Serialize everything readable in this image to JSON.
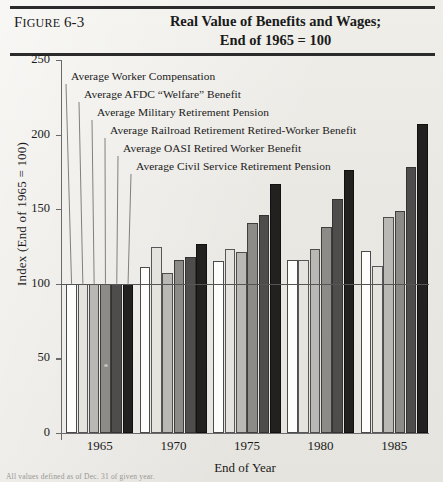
{
  "figure": {
    "label_prefix": "F",
    "label_rest": "IGURE",
    "number": "6-3",
    "title_line1": "Real Value of Benefits and Wages;",
    "title_line2": "End of 1965 = 100"
  },
  "footnote": "All values defined as of Dec. 31 of given year.",
  "chart_data": {
    "type": "bar",
    "title": "Real Value of Benefits and Wages; End of 1965 = 100",
    "xlabel": "End of Year",
    "ylabel": "Index (End of 1965 = 100)",
    "categories": [
      "1965",
      "1970",
      "1975",
      "1980",
      "1985"
    ],
    "ylim": [
      0,
      250
    ],
    "yticks": [
      0,
      50,
      100,
      150,
      200,
      250
    ],
    "ytick_labels": [
      "0",
      "50",
      "100",
      "150",
      "200",
      "250"
    ],
    "grid": false,
    "reference_line": 100,
    "legend_position": "callout-labels-upper-left",
    "series": [
      {
        "name": "Average Worker Compensation",
        "swatch": "#fdfdfb",
        "values": [
          100,
          111,
          115,
          116,
          122
        ]
      },
      {
        "name": "Average AFDC “Welfare” Benefit",
        "swatch": "#e4e3de",
        "values": [
          100,
          125,
          123,
          116,
          112
        ]
      },
      {
        "name": "Average Military Retirement Pension",
        "swatch": "#b9b8b4",
        "values": [
          100,
          107,
          121,
          123,
          145
        ]
      },
      {
        "name": "Average Railroad Retirement Retired-Worker Benefit",
        "swatch": "#8c8b88",
        "values": [
          100,
          116,
          141,
          138,
          149
        ]
      },
      {
        "name": "Average OASI Retired Worker Benefit",
        "swatch": "#4e4d4b",
        "values": [
          100,
          118,
          146,
          157,
          178
        ]
      },
      {
        "name": "Average Civil Service Retirement Pension",
        "swatch": "#222120",
        "values": [
          100,
          127,
          167,
          176,
          207
        ]
      }
    ]
  }
}
